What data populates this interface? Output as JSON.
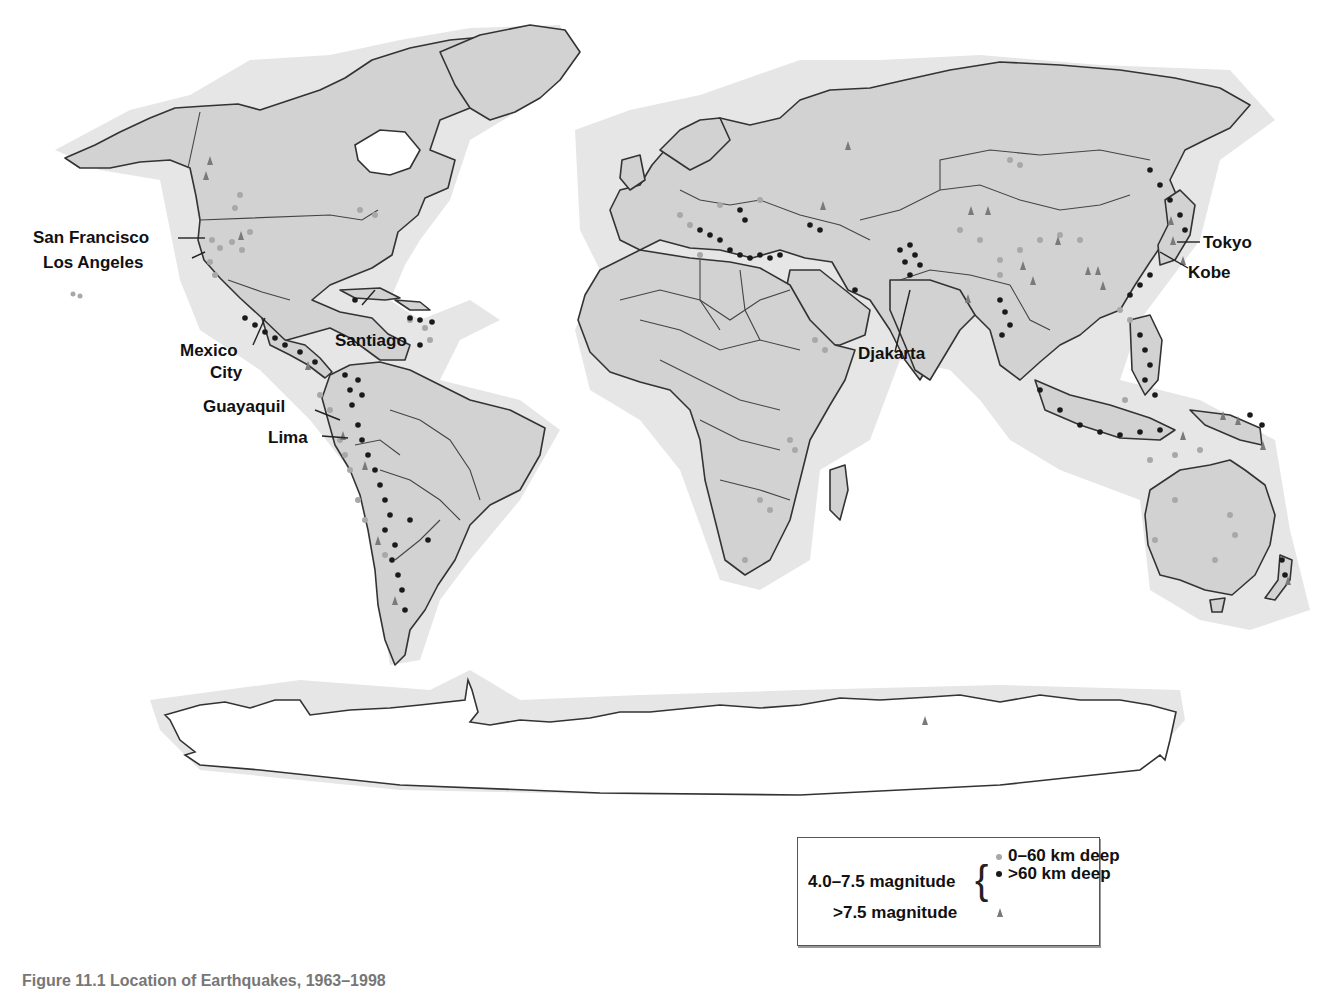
{
  "figure": {
    "title": "Location of Earthquakes",
    "caption_clipped": "Figure 11.1   Location of Earthquakes, 1963–1998"
  },
  "colors": {
    "land": "#d2d2d2",
    "coast_halo": "#e6e6e6",
    "shallow_quake": "#a8a8a8",
    "deep_quake": "#1a1a1a",
    "major_quake": "#7a7a7a"
  },
  "labels": [
    {
      "id": "san-francisco",
      "text": "San Francisco"
    },
    {
      "id": "los-angeles",
      "text": "Los Angeles"
    },
    {
      "id": "mexico-city-1",
      "text": "Mexico"
    },
    {
      "id": "mexico-city-2",
      "text": "City"
    },
    {
      "id": "santiago",
      "text": "Santiago"
    },
    {
      "id": "guayaquil",
      "text": "Guayaquil"
    },
    {
      "id": "lima",
      "text": "Lima"
    },
    {
      "id": "djakarta",
      "text": "Djakarta"
    },
    {
      "id": "tokyo",
      "text": "Tokyo"
    },
    {
      "id": "kobe",
      "text": "Kobe"
    }
  ],
  "legend": {
    "moderate_label": "4.0–7.5 magnitude",
    "shallow_label": "0–60 km deep",
    "deep_label": ">60 km deep",
    "major_label": ">7.5 magnitude",
    "brace": "{"
  },
  "icons": {
    "shallow": "circle-light-gray",
    "deep": "circle-black",
    "major": "triangle-gray"
  }
}
